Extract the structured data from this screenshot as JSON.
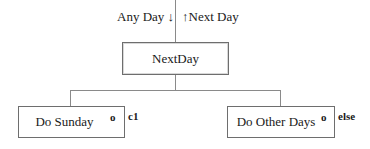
{
  "diagram": {
    "type": "jackson-structure-diagram",
    "data_flows": {
      "input_label": "Any Day",
      "input_arrow": "↓",
      "output_arrow": "↑",
      "output_label": "Next Day"
    },
    "root": {
      "label": "NextDay"
    },
    "children": [
      {
        "label": "Do Sunday",
        "marker": "o",
        "condition": "c1"
      },
      {
        "label": "Do Other Days",
        "marker": "o",
        "condition": "else"
      }
    ],
    "colors": {
      "line": "#8a8a8a",
      "border": "#6e6e6e",
      "text": "#1a1a1a"
    }
  }
}
